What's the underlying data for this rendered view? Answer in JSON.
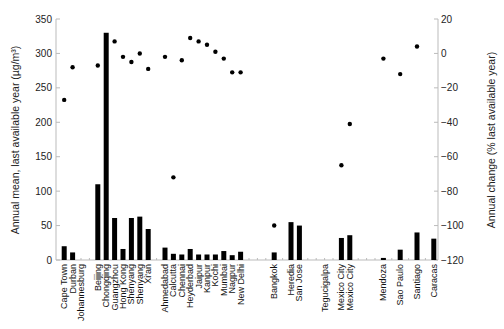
{
  "chart_data": {
    "type": "bar",
    "title": "",
    "xlabel": "",
    "ylabel": "Annual mean, last available year (µg/m³)",
    "ylabel_right": "Annual change (% last available year)",
    "ylim": [
      0,
      350
    ],
    "ylim_right": [
      -120,
      20
    ],
    "yticks": [
      0,
      50,
      100,
      150,
      200,
      250,
      300,
      350
    ],
    "yticks_right": [
      20,
      0,
      -20,
      -40,
      -60,
      -80,
      -100,
      -120
    ],
    "grid": false,
    "legend": null,
    "groups": [
      {
        "region": "South Africa",
        "start": 0
      },
      {
        "region": "China",
        "start": 4
      },
      {
        "region": "India",
        "start": 12
      },
      {
        "region": "Asia/Central America",
        "start": 23
      },
      {
        "region": "Latin America",
        "start": 30
      }
    ],
    "categories": [
      "Cape Town",
      "Durban",
      "Johannesburg",
      "",
      "Beijing",
      "Chongqing",
      "Guangzhou",
      "Hong Kong",
      "Shenyang",
      "Shenyang",
      "Xi'an",
      "",
      "Ahmedabad",
      "Calcutta",
      "Chennai",
      "Heyderbad",
      "Jaipur",
      "Kanpur",
      "Kochi",
      "Mumbai",
      "Nagpur",
      "New Delhi",
      "",
      "",
      "",
      "Bangkok",
      "",
      "Heredia",
      "San Jose",
      "",
      "",
      "Tegucigalpa",
      "",
      "Mexico City",
      "Mexico City",
      "",
      "",
      "",
      "Mendoza",
      "",
      "Sao Paulo",
      "",
      "Santiago",
      "",
      "Caracas"
    ],
    "series": [
      {
        "name": "Annual mean (µg/m³)",
        "type": "bar",
        "axis": "left",
        "values": [
          20,
          11,
          null,
          null,
          110,
          330,
          61,
          16,
          61,
          63,
          45,
          null,
          18,
          9,
          8,
          16,
          8,
          8,
          8,
          13,
          7,
          12,
          null,
          null,
          null,
          11,
          null,
          55,
          50,
          null,
          null,
          null,
          null,
          32,
          36,
          null,
          null,
          null,
          3,
          null,
          15,
          null,
          40,
          null,
          31
        ]
      },
      {
        "name": "Annual change (%)",
        "type": "scatter",
        "axis": "right",
        "values": [
          -27,
          -8,
          null,
          null,
          -7,
          null,
          7,
          -2,
          -5,
          0,
          -9,
          null,
          -2,
          -72,
          -4,
          9,
          7,
          5,
          1,
          -3,
          -11,
          -11,
          null,
          null,
          null,
          -100,
          null,
          null,
          null,
          null,
          null,
          null,
          null,
          -65,
          -41,
          null,
          null,
          null,
          -3,
          null,
          -12,
          null,
          4,
          null,
          null
        ]
      }
    ]
  },
  "colors": {
    "bar": "#000000",
    "dot": "#000000",
    "axis": "#bbbbbb",
    "text": "#222222"
  }
}
